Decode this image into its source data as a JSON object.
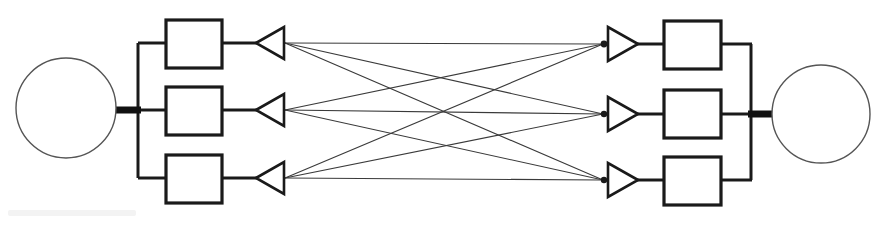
{
  "diagram": {
    "type": "schematic",
    "canvas": {
      "width": 878,
      "height": 225,
      "background": "#ffffff"
    },
    "stroke_colors": {
      "outline": "#1a1a1a",
      "thin_link": "#3a3a3a",
      "circle_outline": "#555555",
      "bus_thick": "#111111"
    },
    "stroke_widths": {
      "box": 3.2,
      "bus": 3.0,
      "thick_stub": 7.0,
      "circle": 1.4,
      "triangle": 2.6,
      "crossbar_link": 1.1
    },
    "left_source": {
      "label": "left-circle-node",
      "cx": 66,
      "cy": 108,
      "r": 50
    },
    "right_source": {
      "label": "right-circle-node",
      "cx": 821,
      "cy": 114,
      "r": 49
    },
    "left_stub": {
      "x1": 112,
      "y1": 110,
      "x2": 141,
      "y2": 110
    },
    "right_stub": {
      "x1": 748,
      "y1": 114,
      "x2": 779,
      "y2": 114
    },
    "left_bus": {
      "x": 138,
      "y_top": 43,
      "y_bottom": 178
    },
    "right_bus": {
      "x": 751,
      "y_top": 44,
      "y_bottom": 180
    },
    "left_boxes": [
      {
        "name": "left-box-1",
        "x": 166,
        "y": 20,
        "w": 56,
        "h": 48,
        "row_y": 43
      },
      {
        "name": "left-box-2",
        "x": 166,
        "y": 87,
        "w": 56,
        "h": 48,
        "row_y": 110
      },
      {
        "name": "left-box-3",
        "x": 166,
        "y": 155,
        "w": 56,
        "h": 48,
        "row_y": 178
      }
    ],
    "right_boxes": [
      {
        "name": "right-box-1",
        "x": 664,
        "y": 21,
        "w": 57,
        "h": 48,
        "row_y": 44
      },
      {
        "name": "right-box-2",
        "x": 664,
        "y": 90,
        "w": 57,
        "h": 48,
        "row_y": 114
      },
      {
        "name": "right-box-3",
        "x": 664,
        "y": 157,
        "w": 57,
        "h": 48,
        "row_y": 180
      }
    ],
    "left_triangles": [
      {
        "name": "left-triangle-1",
        "apex_x": 256,
        "base_x": 284,
        "cy": 43,
        "half_h": 16,
        "direction": "left"
      },
      {
        "name": "left-triangle-2",
        "apex_x": 256,
        "base_x": 284,
        "cy": 110,
        "half_h": 16,
        "direction": "left"
      },
      {
        "name": "left-triangle-3",
        "apex_x": 256,
        "base_x": 284,
        "cy": 178,
        "half_h": 16,
        "direction": "left"
      }
    ],
    "right_triangles": [
      {
        "name": "right-triangle-1",
        "base_x": 608,
        "apex_x": 638,
        "cy": 44,
        "half_h": 17,
        "direction": "right"
      },
      {
        "name": "right-triangle-2",
        "base_x": 608,
        "apex_x": 638,
        "cy": 114,
        "half_h": 17,
        "direction": "right"
      },
      {
        "name": "right-triangle-3",
        "base_x": 608,
        "apex_x": 638,
        "cy": 180,
        "half_h": 17,
        "direction": "right"
      }
    ],
    "junction_dots": [
      {
        "name": "junction-dot-1",
        "cx": 604,
        "cy": 44,
        "r": 3.4
      },
      {
        "name": "junction-dot-2",
        "cx": 604,
        "cy": 114,
        "r": 3.2
      },
      {
        "name": "junction-dot-3",
        "cx": 604,
        "cy": 180,
        "r": 3.2
      }
    ],
    "crossbar_links": [
      {
        "name": "link-L1-R1",
        "from": 1,
        "to": 1,
        "x1": 285,
        "y1": 43,
        "x2": 603,
        "y2": 44
      },
      {
        "name": "link-L1-R2",
        "from": 1,
        "to": 2,
        "x1": 285,
        "y1": 43,
        "x2": 603,
        "y2": 114
      },
      {
        "name": "link-L1-R3",
        "from": 1,
        "to": 3,
        "x1": 285,
        "y1": 43,
        "x2": 603,
        "y2": 180
      },
      {
        "name": "link-L2-R1",
        "from": 2,
        "to": 1,
        "x1": 285,
        "y1": 110,
        "x2": 603,
        "y2": 44
      },
      {
        "name": "link-L2-R2",
        "from": 2,
        "to": 2,
        "x1": 285,
        "y1": 110,
        "x2": 603,
        "y2": 114
      },
      {
        "name": "link-L2-R3",
        "from": 2,
        "to": 3,
        "x1": 285,
        "y1": 110,
        "x2": 603,
        "y2": 180
      },
      {
        "name": "link-L3-R1",
        "from": 3,
        "to": 1,
        "x1": 285,
        "y1": 178,
        "x2": 603,
        "y2": 44
      },
      {
        "name": "link-L3-R2",
        "from": 3,
        "to": 2,
        "x1": 285,
        "y1": 178,
        "x2": 603,
        "y2": 114
      },
      {
        "name": "link-L3-R3",
        "from": 3,
        "to": 3,
        "x1": 285,
        "y1": 178,
        "x2": 603,
        "y2": 180
      }
    ],
    "connector_segments": [
      {
        "name": "left-box1-to-triangle1",
        "x1": 222,
        "y1": 43,
        "x2": 257,
        "y2": 43
      },
      {
        "name": "left-box2-to-triangle2",
        "x1": 222,
        "y1": 110,
        "x2": 257,
        "y2": 110
      },
      {
        "name": "left-box3-to-triangle3",
        "x1": 222,
        "y1": 178,
        "x2": 257,
        "y2": 178
      },
      {
        "name": "left-bus-to-box1",
        "x1": 138,
        "y1": 43,
        "x2": 167,
        "y2": 43
      },
      {
        "name": "left-bus-to-box2",
        "x1": 138,
        "y1": 110,
        "x2": 167,
        "y2": 110
      },
      {
        "name": "left-bus-to-box3",
        "x1": 138,
        "y1": 178,
        "x2": 167,
        "y2": 178
      },
      {
        "name": "right-triangle1-to-box1",
        "x1": 637,
        "y1": 44,
        "x2": 665,
        "y2": 44
      },
      {
        "name": "right-triangle2-to-box2",
        "x1": 637,
        "y1": 114,
        "x2": 665,
        "y2": 114
      },
      {
        "name": "right-triangle3-to-box3",
        "x1": 637,
        "y1": 180,
        "x2": 665,
        "y2": 180
      },
      {
        "name": "right-box1-to-bus",
        "x1": 720,
        "y1": 44,
        "x2": 752,
        "y2": 44
      },
      {
        "name": "right-box2-to-bus",
        "x1": 720,
        "y1": 114,
        "x2": 752,
        "y2": 114
      },
      {
        "name": "right-box3-to-bus",
        "x1": 720,
        "y1": 180,
        "x2": 752,
        "y2": 180
      }
    ],
    "artifact": {
      "name": "scan-smudge",
      "description": "faint gray scan artifact at lower left"
    }
  }
}
